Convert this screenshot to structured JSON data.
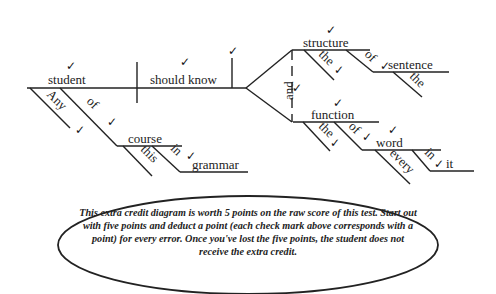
{
  "diagram": {
    "type": "sentence diagram",
    "words": {
      "subject": "student",
      "verb": "should know",
      "any": "Any",
      "of1": "of",
      "course": "course",
      "this": "this",
      "in1": "in",
      "grammar": "grammar",
      "conjunction": "and",
      "structure": "structure",
      "the1": "the",
      "of2": "of",
      "sentence": "sentence",
      "the2": "the",
      "function": "function",
      "the3": "the",
      "of3": "of",
      "word": "word",
      "every": "every",
      "in2": "in",
      "it": "it"
    },
    "check_mark": "✓",
    "check_count": 15
  },
  "note": {
    "text": "This extra credit diagram is worth 5 points on the raw score of this test.  Start out with five points and deduct a point (each check mark above corresponds with a point) for every error. Once you've lost the five points, the student does not receive the extra credit."
  }
}
